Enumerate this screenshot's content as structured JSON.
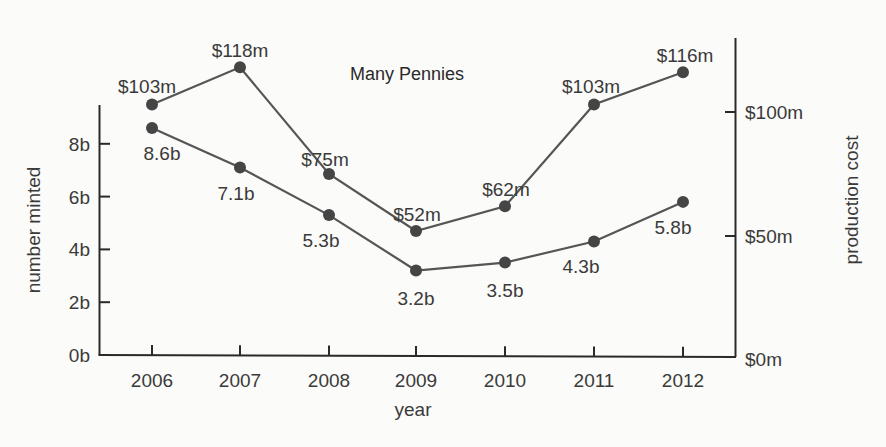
{
  "chart_data": {
    "type": "line",
    "title": "Many Pennies",
    "xlabel": "year",
    "ylabel_left": "number minted",
    "ylabel_right": "production cost",
    "categories": [
      "2006",
      "2007",
      "2008",
      "2009",
      "2010",
      "2011",
      "2012"
    ],
    "series": [
      {
        "name": "number minted",
        "axis": "left",
        "unit": "billions",
        "values": [
          8.6,
          7.1,
          5.3,
          3.2,
          3.5,
          4.3,
          5.8
        ],
        "labels": [
          "8.6b",
          "7.1b",
          "5.3b",
          "3.2b",
          "3.5b",
          "4.3b",
          "5.8b"
        ]
      },
      {
        "name": "production cost",
        "axis": "right",
        "unit": "millions USD",
        "values": [
          103,
          118,
          75,
          52,
          62,
          103,
          116
        ],
        "labels": [
          "$103m",
          "$118m",
          "$75m",
          "$52m",
          "$62m",
          "$103m",
          "$116m"
        ]
      }
    ],
    "y_left": {
      "ticks": [
        "0b",
        "2b",
        "4b",
        "6b",
        "8b"
      ],
      "range": [
        0,
        9.5
      ]
    },
    "y_right": {
      "ticks": [
        "$0m",
        "$50m",
        "$100m"
      ],
      "range": [
        0,
        130
      ]
    },
    "grid": false,
    "legend": null
  },
  "colors": {
    "line": "#555555",
    "marker": "#454545",
    "text": "#3a3a3a",
    "axis": "#2a2a2a"
  }
}
